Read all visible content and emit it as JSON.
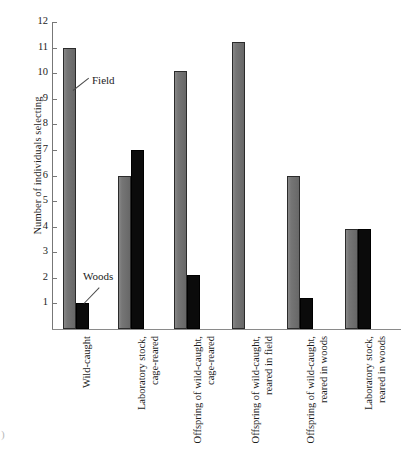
{
  "figure": {
    "corner_mark": ")"
  },
  "chart_data": {
    "type": "bar",
    "title": "",
    "xlabel": "",
    "ylabel": "Number of individuals selecting",
    "ylim": [
      0,
      12
    ],
    "ytick_labels": [
      "12",
      "11",
      "10",
      "9",
      "8",
      "7",
      "6",
      "5",
      "4",
      "3",
      "2",
      "1"
    ],
    "yticks": [
      12,
      11,
      10,
      9,
      8,
      7,
      6,
      5,
      4,
      3,
      2,
      1
    ],
    "grid": false,
    "legend_position": "in-plot-annotations",
    "categories": [
      "Wild-caught",
      "Laboratory stock, cage-reared",
      "Offspring of wild-caught, cage-reared",
      "Offspring of wild-caught, reared in field",
      "Offspring of wild-caught, reared in woods",
      "Laboratory stock, reared in woods"
    ],
    "category_lines": [
      [
        "Wild-caught",
        ""
      ],
      [
        "Laboratory stock,",
        "cage-reared"
      ],
      [
        "Offspring of wild-caught,",
        "cage-reared"
      ],
      [
        "Offspring of wild-caught,",
        "reared in field"
      ],
      [
        "Offspring of wild-caught,",
        "reared in woods"
      ],
      [
        "Laboratory stock,",
        "reared in woods"
      ]
    ],
    "series": [
      {
        "name": "Field",
        "color": "#6e6e6e",
        "values": [
          11,
          6,
          10.1,
          11.2,
          6,
          3.9
        ]
      },
      {
        "name": "Woods",
        "color": "#0b0b0b",
        "values": [
          1,
          7,
          2.1,
          0,
          1.2,
          3.9
        ]
      }
    ],
    "annotations": [
      {
        "text": "Field",
        "series": "Field"
      },
      {
        "text": "Woods",
        "series": "Woods"
      }
    ]
  }
}
